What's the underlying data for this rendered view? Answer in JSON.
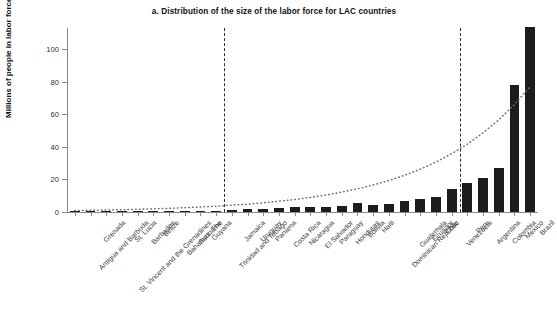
{
  "chart_data": {
    "type": "bar",
    "title": "a. Distribution of the size of the labor force for LAC countries",
    "xlabel": "",
    "ylabel": "Millions of people in labor force",
    "ylim": [
      0,
      115
    ],
    "yticks": [
      0,
      20,
      40,
      60,
      80,
      100
    ],
    "ytick_labels": [
      "0",
      "20",
      "40",
      "60",
      "80",
      "100"
    ],
    "grid": false,
    "legend": "none",
    "bar_color": "#1c1c1c",
    "categories": [
      "Antigua and Barbuda",
      "Grenada",
      "St. Vincent and the Grenadines",
      "St. Lucia",
      "Barbados",
      "Belize",
      "Bahamas, The",
      "Suriname",
      "Guyana",
      "Trinidad and Tobago",
      "Jamaica",
      "Uruguay",
      "Panama",
      "Costa Rica",
      "Nicaragua",
      "El Salvador",
      "Paraguay",
      "Honduras",
      "Bolivia",
      "Haiti",
      "Dominican Republic",
      "Guatemala",
      "Ecuador",
      "Chile",
      "Venezuela",
      "Peru",
      "Argentina",
      "Colombia",
      "Mexico",
      "Brazil"
    ],
    "values": [
      0.05,
      0.05,
      0.06,
      0.09,
      0.15,
      0.16,
      0.2,
      0.24,
      0.3,
      0.7,
      1.3,
      1.7,
      1.8,
      2.3,
      2.8,
      2.9,
      3.2,
      3.6,
      5.4,
      4.5,
      4.8,
      6.5,
      8.0,
      9.0,
      14.0,
      18.0,
      21.0,
      27.0,
      78.0,
      114.0
    ],
    "annotations": {
      "dashed_divider_1_after": "Trinidad and Tobago",
      "dashed_divider_2_after": "Venezuela",
      "trend_curve": "dotted exponential trend across countries"
    }
  }
}
